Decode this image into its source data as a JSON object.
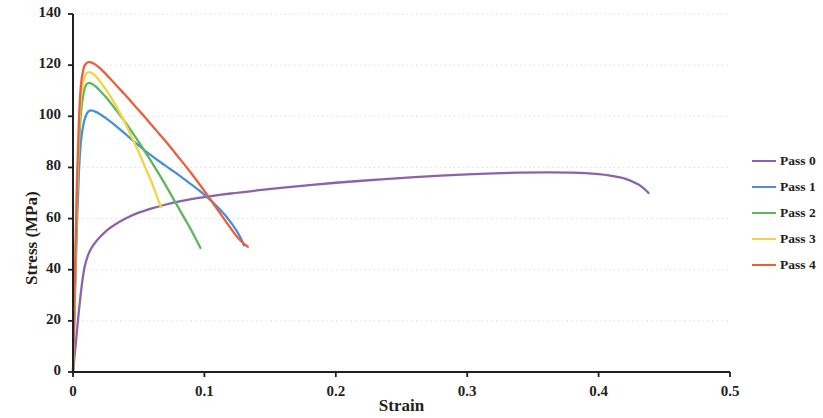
{
  "chart_data": {
    "type": "line",
    "title": "",
    "xlabel": "Strain",
    "ylabel": "Stress (MPa)",
    "xlim": [
      0,
      0.5
    ],
    "ylim": [
      0,
      140
    ],
    "xticks": [
      "0",
      "0.1",
      "0.2",
      "0.3",
      "0.4",
      "0.5"
    ],
    "xtick_values": [
      0,
      0.1,
      0.2,
      0.3,
      0.4,
      0.5
    ],
    "yticks": [
      "0",
      "20",
      "40",
      "60",
      "80",
      "100",
      "120",
      "140"
    ],
    "ytick_values": [
      0,
      20,
      40,
      60,
      80,
      100,
      120,
      140
    ],
    "grid": "horizontal-dotted",
    "legend_position": "right",
    "series": [
      {
        "name": "Pass 0",
        "color": "#8a63ab",
        "points": [
          [
            0.0,
            0.0
          ],
          [
            0.0015,
            8.0
          ],
          [
            0.003,
            16.0
          ],
          [
            0.0045,
            24.0
          ],
          [
            0.006,
            31.0
          ],
          [
            0.0075,
            37.0
          ],
          [
            0.009,
            41.5
          ],
          [
            0.011,
            45.0
          ],
          [
            0.013,
            47.5
          ],
          [
            0.016,
            50.0
          ],
          [
            0.02,
            52.5
          ],
          [
            0.025,
            55.0
          ],
          [
            0.03,
            57.0
          ],
          [
            0.04,
            60.0
          ],
          [
            0.05,
            62.3
          ],
          [
            0.06,
            64.0
          ],
          [
            0.07,
            65.4
          ],
          [
            0.08,
            66.6
          ],
          [
            0.09,
            67.6
          ],
          [
            0.1,
            68.4
          ],
          [
            0.12,
            69.8
          ],
          [
            0.14,
            71.0
          ],
          [
            0.16,
            72.1
          ],
          [
            0.18,
            73.1
          ],
          [
            0.2,
            74.0
          ],
          [
            0.22,
            74.8
          ],
          [
            0.24,
            75.5
          ],
          [
            0.26,
            76.2
          ],
          [
            0.28,
            76.8
          ],
          [
            0.3,
            77.3
          ],
          [
            0.32,
            77.7
          ],
          [
            0.34,
            78.0
          ],
          [
            0.36,
            78.1
          ],
          [
            0.38,
            78.0
          ],
          [
            0.4,
            77.4
          ],
          [
            0.41,
            76.7
          ],
          [
            0.42,
            75.6
          ],
          [
            0.43,
            73.4
          ],
          [
            0.435,
            71.5
          ],
          [
            0.438,
            70.0
          ]
        ]
      },
      {
        "name": "Pass 1",
        "color": "#4a90d9",
        "points": [
          [
            0.0,
            0.0
          ],
          [
            0.0015,
            30.0
          ],
          [
            0.003,
            58.0
          ],
          [
            0.0045,
            78.0
          ],
          [
            0.006,
            90.0
          ],
          [
            0.008,
            97.0
          ],
          [
            0.01,
            100.5
          ],
          [
            0.012,
            102.0
          ],
          [
            0.014,
            102.3
          ],
          [
            0.016,
            102.0
          ],
          [
            0.02,
            101.0
          ],
          [
            0.025,
            99.3
          ],
          [
            0.03,
            97.3
          ],
          [
            0.035,
            95.2
          ],
          [
            0.04,
            93.0
          ],
          [
            0.045,
            90.8
          ],
          [
            0.05,
            88.6
          ],
          [
            0.055,
            86.5
          ],
          [
            0.06,
            84.5
          ],
          [
            0.065,
            82.6
          ],
          [
            0.07,
            80.8
          ],
          [
            0.075,
            79.0
          ],
          [
            0.08,
            77.2
          ],
          [
            0.085,
            75.3
          ],
          [
            0.09,
            73.4
          ],
          [
            0.095,
            71.4
          ],
          [
            0.1,
            69.3
          ],
          [
            0.105,
            67.0
          ],
          [
            0.11,
            64.5
          ],
          [
            0.115,
            61.8
          ],
          [
            0.12,
            58.6
          ],
          [
            0.125,
            54.8
          ],
          [
            0.128,
            52.0
          ],
          [
            0.13,
            49.5
          ]
        ]
      },
      {
        "name": "Pass 2",
        "color": "#5cb85c",
        "points": [
          [
            0.0,
            0.0
          ],
          [
            0.0015,
            34.0
          ],
          [
            0.003,
            66.0
          ],
          [
            0.0045,
            88.0
          ],
          [
            0.006,
            101.0
          ],
          [
            0.008,
            109.0
          ],
          [
            0.01,
            112.3
          ],
          [
            0.012,
            113.0
          ],
          [
            0.014,
            112.8
          ],
          [
            0.017,
            111.8
          ],
          [
            0.02,
            110.3
          ],
          [
            0.025,
            107.5
          ],
          [
            0.03,
            104.3
          ],
          [
            0.035,
            101.0
          ],
          [
            0.04,
            97.5
          ],
          [
            0.045,
            93.8
          ],
          [
            0.05,
            90.0
          ],
          [
            0.055,
            86.0
          ],
          [
            0.06,
            82.0
          ],
          [
            0.065,
            77.8
          ],
          [
            0.07,
            73.5
          ],
          [
            0.075,
            69.0
          ],
          [
            0.08,
            64.5
          ],
          [
            0.085,
            60.0
          ],
          [
            0.09,
            55.5
          ],
          [
            0.094,
            51.5
          ],
          [
            0.097,
            48.5
          ]
        ]
      },
      {
        "name": "Pass 3",
        "color": "#f2d544",
        "points": [
          [
            0.0,
            0.0
          ],
          [
            0.0015,
            36.0
          ],
          [
            0.003,
            70.0
          ],
          [
            0.0045,
            93.0
          ],
          [
            0.006,
            107.0
          ],
          [
            0.008,
            114.0
          ],
          [
            0.01,
            116.7
          ],
          [
            0.012,
            117.2
          ],
          [
            0.014,
            117.0
          ],
          [
            0.017,
            115.8
          ],
          [
            0.02,
            114.0
          ],
          [
            0.025,
            110.5
          ],
          [
            0.03,
            106.5
          ],
          [
            0.035,
            102.0
          ],
          [
            0.04,
            97.0
          ],
          [
            0.045,
            91.5
          ],
          [
            0.05,
            86.0
          ],
          [
            0.055,
            80.0
          ],
          [
            0.06,
            74.0
          ],
          [
            0.064,
            68.5
          ],
          [
            0.067,
            64.5
          ]
        ]
      },
      {
        "name": "Pass 4",
        "color": "#e8603c",
        "points": [
          [
            0.0,
            0.0
          ],
          [
            0.0015,
            38.0
          ],
          [
            0.003,
            74.0
          ],
          [
            0.0045,
            98.0
          ],
          [
            0.006,
            112.0
          ],
          [
            0.008,
            118.5
          ],
          [
            0.01,
            120.7
          ],
          [
            0.012,
            121.2
          ],
          [
            0.015,
            120.8
          ],
          [
            0.02,
            119.0
          ],
          [
            0.025,
            116.5
          ],
          [
            0.03,
            113.8
          ],
          [
            0.035,
            111.0
          ],
          [
            0.04,
            108.2
          ],
          [
            0.045,
            105.3
          ],
          [
            0.05,
            102.4
          ],
          [
            0.055,
            99.5
          ],
          [
            0.06,
            96.5
          ],
          [
            0.065,
            93.5
          ],
          [
            0.07,
            90.5
          ],
          [
            0.075,
            87.4
          ],
          [
            0.08,
            84.2
          ],
          [
            0.085,
            81.0
          ],
          [
            0.09,
            77.7
          ],
          [
            0.095,
            74.3
          ],
          [
            0.1,
            70.8
          ],
          [
            0.105,
            67.2
          ],
          [
            0.11,
            63.5
          ],
          [
            0.115,
            59.8
          ],
          [
            0.12,
            56.2
          ],
          [
            0.125,
            52.8
          ],
          [
            0.13,
            50.2
          ],
          [
            0.133,
            49.0
          ]
        ]
      }
    ]
  },
  "axes": {
    "x_label": "Strain",
    "y_label": "Stress (MPa)",
    "x_tick_labels": [
      "0",
      "0.1",
      "0.2",
      "0.3",
      "0.4",
      "0.5"
    ],
    "y_tick_labels": [
      "0",
      "20",
      "40",
      "60",
      "80",
      "100",
      "120",
      "140"
    ]
  },
  "legend": {
    "items": [
      {
        "label": "Pass 0",
        "color": "#8a63ab"
      },
      {
        "label": "Pass 1",
        "color": "#4a90d9"
      },
      {
        "label": "Pass 2",
        "color": "#5cb85c"
      },
      {
        "label": "Pass 3",
        "color": "#f2d544"
      },
      {
        "label": "Pass 4",
        "color": "#e8603c"
      }
    ]
  },
  "style": {
    "axis_color": "#231f20",
    "grid_color": "#d9d2e0",
    "background": "#ffffff"
  }
}
